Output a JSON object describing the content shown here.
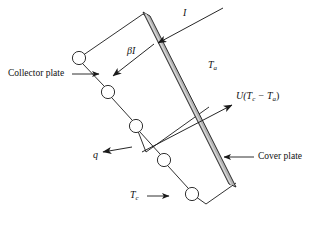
{
  "figure": {
    "canvas": {
      "width": 313,
      "height": 229,
      "background": "#ffffff"
    },
    "colors": {
      "line": "#1a1a1a",
      "plate_fill": "#b3b3b3",
      "plate_edge": "#1a1a1a",
      "tube_fill": "#ffffff",
      "background": "#ffffff"
    },
    "labels": {
      "incident_radiation": "I",
      "absorbed_radiation": "βI",
      "ambient_temperature": "T",
      "ambient_temperature_sub": "a",
      "collector_temperature": "T",
      "collector_temperature_sub": "c",
      "useful_heat": "q",
      "heat_loss_prefix": "U(T",
      "heat_loss_sub1": "c",
      "heat_loss_minus": " − T",
      "heat_loss_sub2": "a",
      "heat_loss_suffix": ")",
      "collector_plate": "Collector plate",
      "cover_plate": "Cover plate"
    },
    "elements": {
      "cover_plate": {
        "name": "cover-plate",
        "description": "Shaded inclined glazing band",
        "top": [
          146,
          13
        ],
        "bottom": [
          233,
          185
        ],
        "thickness": 7
      },
      "collector_plate": {
        "name": "collector-plate",
        "description": "Zigzag chain of circular tubes representing absorber plate",
        "tube_radius": 6.5,
        "tubes": [
          [
            79,
            58
          ],
          [
            108,
            92
          ],
          [
            136,
            126
          ],
          [
            164,
            160
          ],
          [
            192,
            194
          ]
        ]
      },
      "arrows": [
        {
          "name": "incident-radiation-arrow",
          "from": [
            222,
            10
          ],
          "to": [
            156,
            44
          ],
          "label": "I"
        },
        {
          "name": "absorbed-radiation-arrow",
          "from": [
            153,
            45
          ],
          "to": [
            111,
            77
          ],
          "label": "βI"
        },
        {
          "name": "useful-heat-arrow",
          "from": [
            133,
            148
          ],
          "to": [
            102,
            152
          ],
          "label": "q"
        },
        {
          "name": "heat-loss-arrow",
          "from": [
            143,
            151
          ],
          "to": [
            233,
            105
          ],
          "label": "U(Tc - Ta)"
        },
        {
          "name": "collector-plate-callout-arrow",
          "from": [
            73,
            74
          ],
          "to": [
            100,
            74
          ],
          "label": "Collector plate"
        },
        {
          "name": "cover-plate-callout-arrow",
          "from": [
            253,
            157
          ],
          "to": [
            222,
            157
          ],
          "label": "Cover plate"
        },
        {
          "name": "collector-temperature-arrow",
          "from": [
            147,
            197
          ],
          "to": [
            170,
            197
          ],
          "label": "Tc"
        }
      ]
    }
  }
}
